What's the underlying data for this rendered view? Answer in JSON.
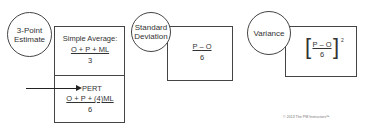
{
  "diagram": {
    "three_point": {
      "circle_label_line1": "3-Point",
      "circle_label_line2": "Estimate",
      "simple_average": {
        "label": "Simple Average:",
        "numerator": "O + P + ML",
        "denominator": "3"
      },
      "pert": {
        "label": "PERT",
        "numerator": "O + P + (4)ML",
        "denominator": "6"
      }
    },
    "standard_deviation": {
      "circle_label_line1": "Standard",
      "circle_label_line2": "Deviation",
      "numerator": "P – O",
      "denominator": "6"
    },
    "variance": {
      "circle_label": "Variance",
      "left_bracket": "[",
      "right_bracket": "]",
      "numerator": "P – O",
      "denominator": "6",
      "exponent": "2"
    },
    "copyright": "© 2013 The PM Instructors™"
  },
  "colors": {
    "line": "#444444",
    "text": "#333333",
    "background": "#ffffff"
  }
}
